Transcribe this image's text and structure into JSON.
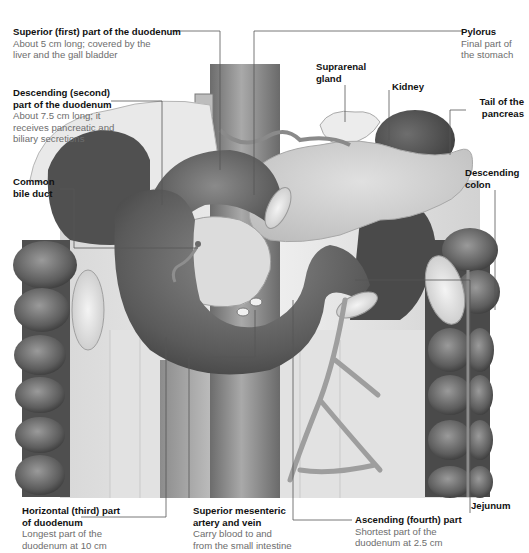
{
  "diagram": {
    "colors": {
      "background": "#ffffff",
      "label_title": "#111111",
      "label_description": "#6d6d6d",
      "leader_line": "#555555",
      "duodenum": "#5e5e5e",
      "colon": "#5a5a5a",
      "pancreas": "#cfcfcf",
      "kidney": "#4e4e4e",
      "aorta": "#8a8a8a",
      "mesentery": "#e6e6e6"
    },
    "labels": [
      {
        "id": "superior",
        "title": "Superior (first) part of the duodenum",
        "description": "About 5 cm long; covered by the liver and the gall bladder"
      },
      {
        "id": "pylorus",
        "title": "Pylorus",
        "description": "Final part of the stomach"
      },
      {
        "id": "descending",
        "title": "Descending (second) part of the duodenum",
        "title_lines": [
          "Descending (second)",
          "part of the duodenum"
        ],
        "description": "About 7.5 cm long; it receives pancreatic and biliary secretions",
        "description_lines": [
          "About 7.5 cm long; it",
          "receives pancreatic and",
          "biliary secretions"
        ]
      },
      {
        "id": "suprarenal",
        "title": "Suprarenal gland",
        "title_lines": [
          "Suprarenal",
          "gland"
        ]
      },
      {
        "id": "kidney",
        "title": "Kidney"
      },
      {
        "id": "tail-pancreas",
        "title": "Tail of the pancreas",
        "title_lines": [
          "Tail of the",
          "pancreas"
        ]
      },
      {
        "id": "common-bile-duct",
        "title": "Common bile duct",
        "title_lines": [
          "Common",
          "bile duct"
        ]
      },
      {
        "id": "descending-colon",
        "title": "Descending colon",
        "title_lines": [
          "Descending",
          "colon"
        ]
      },
      {
        "id": "horizontal",
        "title": "Horizontal (third) part of duodenum",
        "title_lines": [
          "Horizontal (third) part",
          "of duodenum"
        ],
        "description": "Longest part of the duodenum at 10 cm",
        "description_lines": [
          "Longest part of the",
          "duodenum at 10 cm"
        ]
      },
      {
        "id": "sma",
        "title": "Superior mesenteric artery and vein",
        "title_lines": [
          "Superior mesenteric",
          "artery and vein"
        ],
        "description": "Carry blood to and from the small intestine",
        "description_lines": [
          "Carry blood to and",
          "from the small intestine"
        ]
      },
      {
        "id": "ascending",
        "title": "Ascending (fourth) part",
        "description": "Shortest part of the duodenum at 2.5 cm",
        "description_lines": [
          "Shortest part of the",
          "duodenum at 2.5 cm"
        ]
      },
      {
        "id": "jejunum",
        "title": "Jejunum"
      }
    ]
  }
}
